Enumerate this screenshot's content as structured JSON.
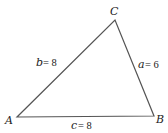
{
  "diagram": {
    "type": "triangle",
    "stroke_color": "#555555",
    "vertices": [
      {
        "id": "A",
        "label": "A",
        "x": 17,
        "y": 117
      },
      {
        "id": "B",
        "label": "B",
        "x": 154,
        "y": 116
      },
      {
        "id": "C",
        "label": "C",
        "x": 115,
        "y": 20
      }
    ],
    "sides": [
      {
        "id": "a",
        "var": "a",
        "eq": "= 6",
        "between": [
          "B",
          "C"
        ]
      },
      {
        "id": "b",
        "var": "b",
        "eq": "= 8",
        "between": [
          "A",
          "C"
        ]
      },
      {
        "id": "c",
        "var": "c",
        "eq": "= 8",
        "between": [
          "A",
          "B"
        ]
      }
    ]
  }
}
